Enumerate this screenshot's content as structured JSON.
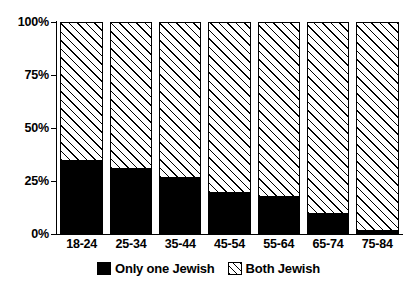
{
  "chart_data": {
    "type": "bar",
    "stacked": true,
    "normalized": true,
    "title": "",
    "subtitle": "",
    "xlabel": "",
    "ylabel": "",
    "categories": [
      "18-24",
      "25-34",
      "35-44",
      "45-54",
      "55-64",
      "65-74",
      "75-84"
    ],
    "series": [
      {
        "name": "Only one Jewish",
        "color": "#000000",
        "pattern": "solid-black",
        "values": [
          35,
          31,
          27,
          20,
          18,
          10,
          2
        ]
      },
      {
        "name": "Both Jewish",
        "color": "#ffffff",
        "pattern": "diagonal-hatch",
        "values": [
          65,
          69,
          73,
          80,
          82,
          90,
          98
        ]
      }
    ],
    "ylim": [
      0,
      100
    ],
    "yticks": [
      0,
      25,
      50,
      75,
      100
    ],
    "ytick_labels": [
      "0%",
      "25%",
      "50%",
      "75%",
      "100%"
    ],
    "grid": false,
    "legend_position": "bottom-center",
    "legend_entries": [
      "Only one Jewish",
      "Both Jewish"
    ]
  },
  "axes": {
    "y": {
      "ticks": [
        {
          "label": "100%",
          "value": 100
        },
        {
          "label": "75%",
          "value": 75
        },
        {
          "label": "50%",
          "value": 50
        },
        {
          "label": "25%",
          "value": 25
        },
        {
          "label": "0%",
          "value": 0
        }
      ]
    },
    "x": {
      "ticks": [
        {
          "label": "18-24"
        },
        {
          "label": "25-34"
        },
        {
          "label": "35-44"
        },
        {
          "label": "45-54"
        },
        {
          "label": "55-64"
        },
        {
          "label": "65-74"
        },
        {
          "label": "75-84"
        }
      ]
    }
  },
  "legend": {
    "items": [
      {
        "label": "Only one Jewish",
        "swatch": "solid-black-swatch"
      },
      {
        "label": "Both Jewish",
        "swatch": "diagonal-hatch-swatch"
      }
    ]
  }
}
